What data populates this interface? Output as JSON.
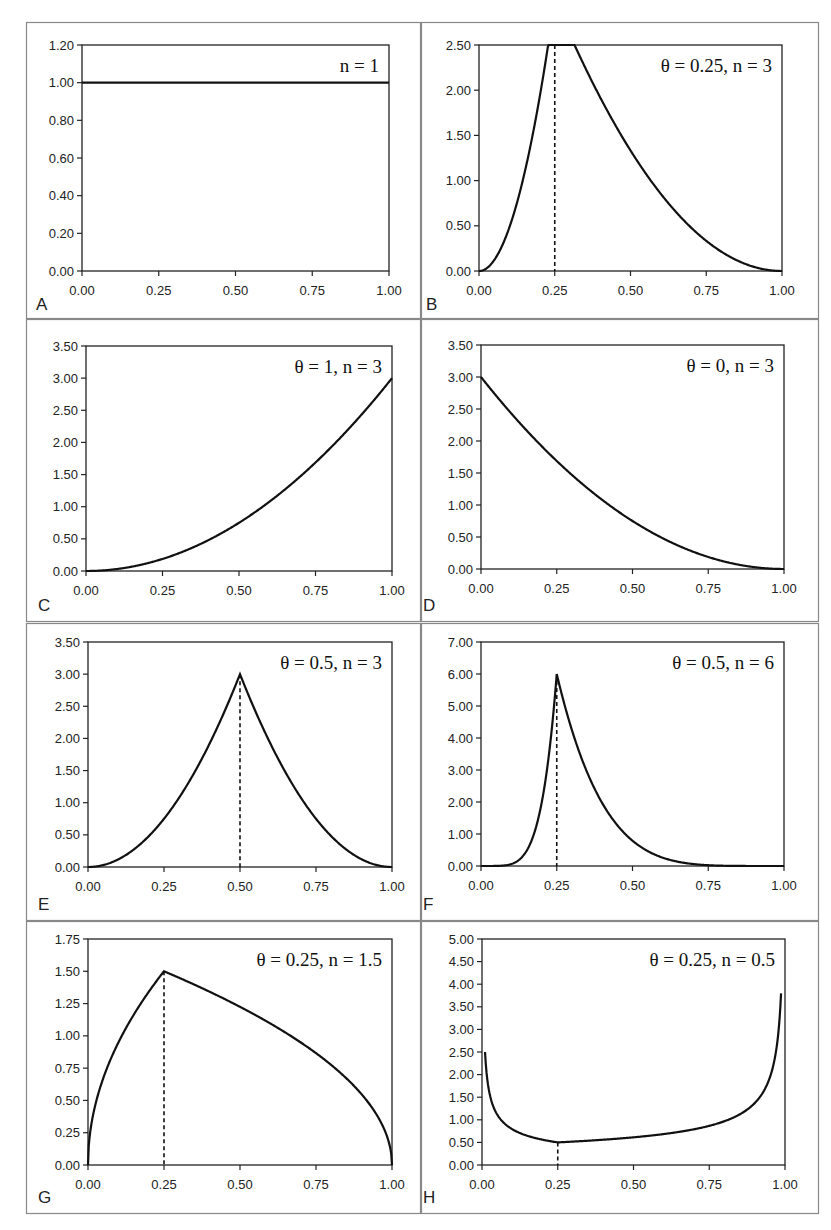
{
  "chart_data": [
    {
      "panel": "A",
      "type": "line",
      "annotation": "n = 1",
      "xlim": [
        0,
        1
      ],
      "ylim": [
        0,
        1.2
      ],
      "xticks": [
        "0.00",
        "0.25",
        "0.50",
        "0.75",
        "1.00"
      ],
      "yticks": [
        "0.00",
        "0.20",
        "0.40",
        "0.60",
        "0.80",
        "1.00",
        "1.20"
      ],
      "theta": null,
      "n": 1,
      "mode": "uniform",
      "series": [
        {
          "name": "density",
          "x": [
            0,
            1
          ],
          "y": [
            1.0,
            1.0
          ]
        }
      ]
    },
    {
      "panel": "B",
      "type": "line",
      "annotation": "θ = 0.25, n = 3",
      "xlim": [
        0,
        1
      ],
      "ylim": [
        0,
        2.5
      ],
      "xticks": [
        "0.00",
        "0.25",
        "0.50",
        "0.75",
        "1.00"
      ],
      "yticks": [
        "0.00",
        "0.50",
        "1.00",
        "1.50",
        "2.00",
        "2.50"
      ],
      "theta": 0.25,
      "n": 3,
      "mode": "tsp",
      "dashed_x": 0.25,
      "series": [
        {
          "name": "density",
          "x": [
            0,
            0.25,
            1
          ],
          "y": [
            0,
            2.0,
            0
          ]
        }
      ]
    },
    {
      "panel": "C",
      "type": "line",
      "annotation": "θ = 1, n = 3",
      "xlim": [
        0,
        1
      ],
      "ylim": [
        0,
        3.5
      ],
      "xticks": [
        "0.00",
        "0.25",
        "0.50",
        "0.75",
        "1.00"
      ],
      "yticks": [
        "0.00",
        "0.50",
        "1.00",
        "1.50",
        "2.00",
        "2.50",
        "3.00",
        "3.50"
      ],
      "theta": 1,
      "n": 3,
      "mode": "tsp",
      "series": [
        {
          "name": "density",
          "x": [
            0,
            0.25,
            0.5,
            0.75,
            1.0
          ],
          "y": [
            0,
            0.19,
            0.75,
            1.69,
            3.0
          ]
        }
      ]
    },
    {
      "panel": "D",
      "type": "line",
      "annotation": "θ = 0, n = 3",
      "xlim": [
        0,
        1
      ],
      "ylim": [
        0,
        3.5
      ],
      "xticks": [
        "0.00",
        "0.25",
        "0.50",
        "0.75",
        "1.00"
      ],
      "yticks": [
        "0.00",
        "0.50",
        "1.00",
        "1.50",
        "2.00",
        "2.50",
        "3.00",
        "3.50"
      ],
      "theta": 0,
      "n": 3,
      "mode": "tsp",
      "series": [
        {
          "name": "density",
          "x": [
            0,
            0.25,
            0.5,
            0.75,
            1.0
          ],
          "y": [
            3.0,
            1.69,
            0.75,
            0.19,
            0
          ]
        }
      ]
    },
    {
      "panel": "E",
      "type": "line",
      "annotation": "θ = 0.5, n = 3",
      "xlim": [
        0,
        1
      ],
      "ylim": [
        0,
        3.5
      ],
      "xticks": [
        "0.00",
        "0.25",
        "0.50",
        "0.75",
        "1.00"
      ],
      "yticks": [
        "0.00",
        "0.50",
        "1.00",
        "1.50",
        "2.00",
        "2.50",
        "3.00",
        "3.50"
      ],
      "theta": 0.5,
      "n": 3,
      "mode": "tsp",
      "dashed_x": 0.5,
      "series": [
        {
          "name": "density",
          "x": [
            0,
            0.25,
            0.5,
            0.75,
            1.0
          ],
          "y": [
            0,
            0.75,
            3.0,
            0.75,
            0
          ]
        }
      ]
    },
    {
      "panel": "F",
      "type": "line",
      "annotation": "θ = 0.5, n = 6",
      "xlim": [
        0,
        1
      ],
      "ylim": [
        0,
        7.0
      ],
      "xticks": [
        "0.00",
        "0.25",
        "0.50",
        "0.75",
        "1.00"
      ],
      "yticks": [
        "0.00",
        "1.00",
        "2.00",
        "3.00",
        "4.00",
        "5.00",
        "6.00",
        "7.00"
      ],
      "theta": 0.25,
      "n": 6,
      "mode": "tsp",
      "dashed_x": 0.25,
      "series": [
        {
          "name": "density",
          "x": [
            0,
            0.125,
            0.25,
            0.5,
            0.75,
            1.0
          ],
          "y": [
            0,
            0.19,
            6.0,
            1.05,
            0.03,
            0
          ]
        }
      ]
    },
    {
      "panel": "G",
      "type": "line",
      "annotation": "θ = 0.25, n = 1.5",
      "xlim": [
        0,
        1
      ],
      "ylim": [
        0,
        1.75
      ],
      "xticks": [
        "0.00",
        "0.25",
        "0.50",
        "0.75",
        "1.00"
      ],
      "yticks": [
        "0.00",
        "0.25",
        "0.50",
        "0.75",
        "1.00",
        "1.25",
        "1.50",
        "1.75"
      ],
      "theta": 0.25,
      "n": 1.5,
      "mode": "tsp",
      "dashed_x": 0.25,
      "series": [
        {
          "name": "density",
          "x": [
            0,
            0.0625,
            0.25,
            0.5,
            0.75,
            1.0
          ],
          "y": [
            0,
            0.75,
            1.5,
            1.22,
            0.87,
            0
          ]
        }
      ]
    },
    {
      "panel": "H",
      "type": "line",
      "annotation": "θ = 0.25, n = 0.5",
      "xlim": [
        0,
        1
      ],
      "ylim": [
        0,
        5.0
      ],
      "xticks": [
        "0.00",
        "0.25",
        "0.50",
        "0.75",
        "1.00"
      ],
      "yticks": [
        "0.00",
        "0.50",
        "1.00",
        "1.50",
        "2.00",
        "2.50",
        "3.00",
        "3.50",
        "4.00",
        "4.50",
        "5.00"
      ],
      "theta": 0.25,
      "n": 0.5,
      "mode": "tsp",
      "dashed_x": 0.25,
      "xclip": [
        0.01,
        0.987
      ],
      "series": [
        {
          "name": "density",
          "x": [
            0.01,
            0.05,
            0.25,
            0.5,
            0.75,
            0.9,
            0.987
          ],
          "y": [
            2.5,
            1.12,
            0.5,
            0.61,
            0.82,
            1.3,
            4.35
          ]
        }
      ]
    }
  ],
  "layout": {
    "panels": [
      {
        "box": [
          26,
          22,
          394,
          296
        ],
        "plot": [
          82,
          45,
          389,
          271
        ],
        "label_xy": [
          36,
          310
        ]
      },
      {
        "box": [
          421,
          22,
          397,
          296
        ],
        "plot": [
          479,
          45,
          782,
          271
        ],
        "label_xy": [
          426,
          310
        ]
      },
      {
        "box": [
          26,
          319,
          394,
          302
        ],
        "plot": [
          86,
          346,
          392,
          571
        ],
        "label_xy": [
          38,
          611
        ]
      },
      {
        "box": [
          421,
          319,
          397,
          302
        ],
        "plot": [
          481,
          345,
          784,
          569
        ],
        "label_xy": [
          423,
          611
        ]
      },
      {
        "box": [
          26,
          623,
          394,
          297
        ],
        "plot": [
          88,
          642,
          392,
          867
        ],
        "label_xy": [
          38,
          910
        ]
      },
      {
        "box": [
          421,
          623,
          397,
          297
        ],
        "plot": [
          481,
          642,
          784,
          866
        ],
        "label_xy": [
          423,
          910
        ]
      },
      {
        "box": [
          26,
          921,
          394,
          292
        ],
        "plot": [
          88,
          939,
          392,
          1165
        ],
        "label_xy": [
          38,
          1203
        ]
      },
      {
        "box": [
          421,
          921,
          397,
          292
        ],
        "plot": [
          482,
          939,
          785,
          1165
        ],
        "label_xy": [
          423,
          1203
        ]
      }
    ]
  },
  "colors": {
    "line": "#111111",
    "frame": "#222222",
    "box": "#888888",
    "text": "#222222"
  }
}
